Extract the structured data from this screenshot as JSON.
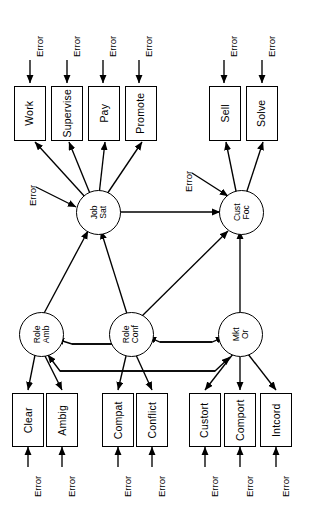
{
  "diagram": {
    "orientation": "rotated-90",
    "stroke_color": "#000000",
    "background_color": "#ffffff"
  },
  "error_label": "Error",
  "errors": {
    "top": [
      {
        "id": "err-work",
        "label": "Error"
      },
      {
        "id": "err-supervise",
        "label": "Error"
      },
      {
        "id": "err-pay",
        "label": "Error"
      },
      {
        "id": "err-promote",
        "label": "Error"
      },
      {
        "id": "err-sell",
        "label": "Error"
      },
      {
        "id": "err-solve",
        "label": "Error"
      }
    ],
    "latent": [
      {
        "id": "err-job-sat",
        "label": "Error"
      },
      {
        "id": "err-cust-foc",
        "label": "Error"
      }
    ],
    "bottom": [
      {
        "id": "err-clear",
        "label": "Error"
      },
      {
        "id": "err-ambig",
        "label": "Error"
      },
      {
        "id": "err-compat",
        "label": "Error"
      },
      {
        "id": "err-conflict",
        "label": "Error"
      },
      {
        "id": "err-custori",
        "label": "Error"
      },
      {
        "id": "err-comport",
        "label": "Error"
      },
      {
        "id": "err-intcord",
        "label": "Error"
      }
    ]
  },
  "observed_top": [
    {
      "id": "work",
      "label": "Work"
    },
    {
      "id": "supervise",
      "label": "Supervise"
    },
    {
      "id": "pay",
      "label": "Pay"
    },
    {
      "id": "promote",
      "label": "Promote"
    },
    {
      "id": "sell",
      "label": "Sell"
    },
    {
      "id": "solve",
      "label": "Solve"
    }
  ],
  "observed_bottom": [
    {
      "id": "clear",
      "label": "Clear"
    },
    {
      "id": "ambig",
      "label": "Ambig"
    },
    {
      "id": "compat",
      "label": "Compat"
    },
    {
      "id": "conflict",
      "label": "Conflict"
    },
    {
      "id": "custori",
      "label": "Custort"
    },
    {
      "id": "comport",
      "label": "Comport"
    },
    {
      "id": "intcord",
      "label": "Intcord"
    }
  ],
  "latents": {
    "job_sat": {
      "id": "job-sat",
      "line1": "Job",
      "line2": "Sat"
    },
    "cust_foc": {
      "id": "cust-foc",
      "line1": "Cust",
      "line2": "Foc"
    },
    "role_amb": {
      "id": "role-amb",
      "line1": "Role",
      "line2": "Amb"
    },
    "role_conf": {
      "id": "role-conf",
      "line1": "Role",
      "line2": "Conf"
    },
    "mkt_or": {
      "id": "mkt-or",
      "line1": "Mkt",
      "line2": "Or"
    }
  },
  "paths": {
    "measurement_job_sat": [
      "Work",
      "Supervise",
      "Pay",
      "Promote"
    ],
    "measurement_cust_foc": [
      "Sell",
      "Solve"
    ],
    "measurement_role_amb": [
      "Clear",
      "Ambig"
    ],
    "measurement_role_conf": [
      "Compat",
      "Conflict"
    ],
    "measurement_mkt_or": [
      "Custort",
      "Comport",
      "Intcord"
    ],
    "structural": [
      "Job Sat -> Cust Foc",
      "Role Amb -> Job Sat",
      "Role Conf -> Job Sat",
      "Role Conf -> Cust Foc",
      "Mkt Or -> Cust Foc"
    ],
    "correlations": [
      "Role Amb <-> Role Conf",
      "Role Conf <-> Mkt Or",
      "Role Amb <-> Mkt Or"
    ]
  }
}
